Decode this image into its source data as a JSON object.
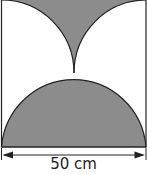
{
  "diagram": {
    "dimension_label": "50 cm",
    "colors": {
      "shade": "#8c8c8c",
      "outline": "#222222",
      "background": "#ffffff"
    },
    "shapes": [
      {
        "type": "square-outline",
        "description": "Square border with side 50 cm"
      },
      {
        "type": "quarter-circle",
        "description": "Quarter circle centered at top-left corner, radius 25 cm (unshaded)"
      },
      {
        "type": "quarter-circle",
        "description": "Quarter circle centered at top-right corner, radius 25 cm (unshaded)"
      },
      {
        "type": "shaded-region",
        "description": "Shaded region at top center between the two quarter circles"
      },
      {
        "type": "semicircle",
        "description": "Shaded semicircle on the bottom side, diameter 50 cm"
      },
      {
        "type": "dimension-arrow",
        "description": "Double-headed arrow spanning width, labeled 50 cm"
      }
    ]
  }
}
